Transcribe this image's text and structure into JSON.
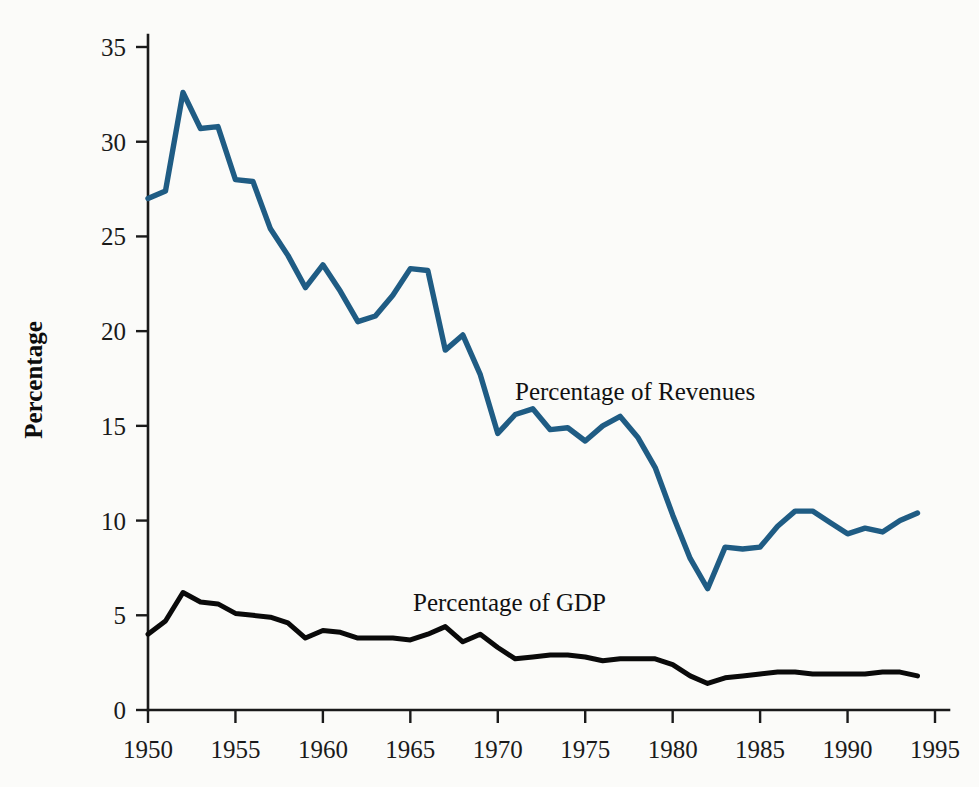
{
  "figure": {
    "background_color": "#fbfbf9",
    "y_axis_title": "Percentage",
    "annotations": {
      "revenues_label": "Percentage of Revenues",
      "gdp_label": "Percentage of GDP"
    }
  },
  "chart_data": {
    "type": "line",
    "title": "",
    "xlabel": "",
    "ylabel": "Percentage",
    "xlim": [
      1950,
      1995
    ],
    "ylim": [
      0,
      35
    ],
    "grid": false,
    "legend_position": "inline-annotation",
    "x_ticks": [
      "1950",
      "1955",
      "1960",
      "1965",
      "1970",
      "1975",
      "1980",
      "1985",
      "1990",
      "1995"
    ],
    "y_ticks": [
      "0",
      "5",
      "10",
      "15",
      "20",
      "25",
      "30",
      "35"
    ],
    "x": [
      1950,
      1951,
      1952,
      1953,
      1954,
      1955,
      1956,
      1957,
      1958,
      1959,
      1960,
      1961,
      1962,
      1963,
      1964,
      1965,
      1966,
      1967,
      1968,
      1969,
      1970,
      1971,
      1972,
      1973,
      1974,
      1975,
      1976,
      1977,
      1978,
      1979,
      1980,
      1981,
      1982,
      1983,
      1984,
      1985,
      1986,
      1987,
      1988,
      1989,
      1990,
      1991,
      1992,
      1993,
      1994
    ],
    "series": [
      {
        "name": "Percentage of Revenues",
        "color": "#1f5c84",
        "values": [
          27.0,
          27.4,
          32.6,
          30.7,
          30.8,
          28.0,
          27.9,
          25.4,
          24.0,
          22.3,
          23.5,
          22.1,
          20.5,
          20.8,
          21.9,
          23.3,
          23.2,
          19.0,
          19.8,
          17.7,
          14.6,
          15.6,
          15.9,
          14.8,
          14.9,
          14.2,
          15.0,
          15.5,
          14.4,
          12.8,
          10.3,
          8.0,
          6.4,
          8.6,
          8.5,
          8.6,
          9.7,
          10.5,
          10.5,
          9.9,
          9.3,
          9.6,
          9.4,
          10.0,
          10.4
        ]
      },
      {
        "name": "Percentage of GDP",
        "color": "#0a0a0a",
        "values": [
          4.0,
          4.7,
          6.2,
          5.7,
          5.6,
          5.1,
          5.0,
          4.9,
          4.6,
          3.8,
          4.2,
          4.1,
          3.8,
          3.8,
          3.8,
          3.7,
          4.0,
          4.4,
          3.6,
          4.0,
          3.3,
          2.7,
          2.8,
          2.9,
          2.9,
          2.8,
          2.6,
          2.7,
          2.7,
          2.7,
          2.4,
          1.8,
          1.4,
          1.7,
          1.8,
          1.9,
          2.0,
          2.0,
          1.9,
          1.9,
          1.9,
          1.9,
          2.0,
          2.0,
          1.8
        ]
      }
    ]
  }
}
